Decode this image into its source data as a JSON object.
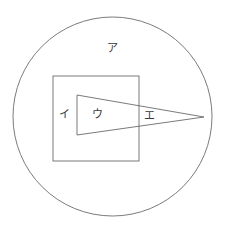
{
  "figure": {
    "title": "",
    "background_color": "#ffffff",
    "stroke_color": "#5a5a5a",
    "label_color": "#3a3a3a",
    "width": 227,
    "height": 229
  },
  "shapes": {
    "circle": {
      "name": "outer-circle",
      "cx": 112.5,
      "cy": 116.5,
      "r": 99.5,
      "stroke": "#6b6b6b",
      "stroke_width": 0.9,
      "fill": "none"
    },
    "square": {
      "name": "inner-square",
      "x": 53,
      "y": 76,
      "width": 86,
      "height": 85,
      "stroke": "#6b6b6b",
      "stroke_width": 0.9,
      "fill": "none"
    },
    "triangle": {
      "name": "inner-triangle",
      "points": "77,95 204,117 77,135",
      "stroke": "#6b6b6b",
      "stroke_width": 0.9,
      "fill": "none"
    }
  },
  "labels": {
    "a": {
      "text": "ア",
      "x": 107,
      "y": 43
    },
    "i": {
      "text": "イ",
      "x": 59,
      "y": 109
    },
    "u": {
      "text": "ウ",
      "x": 92,
      "y": 109
    },
    "e": {
      "text": "エ",
      "x": 144,
      "y": 110
    }
  }
}
